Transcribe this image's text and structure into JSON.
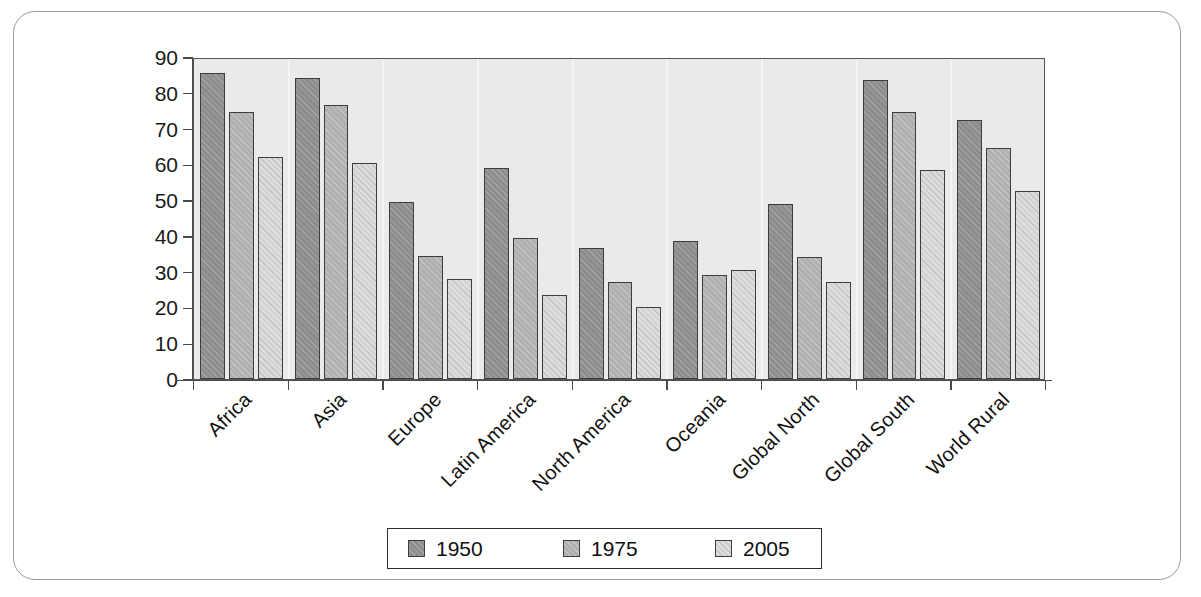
{
  "chart_data": {
    "type": "bar",
    "title": "",
    "subtitle": "",
    "xlabel": "",
    "ylabel": "",
    "ylim": [
      0,
      90
    ],
    "yticks": [
      0,
      10,
      20,
      30,
      40,
      50,
      60,
      70,
      80,
      90
    ],
    "grid": false,
    "legend_position": "bottom",
    "categories": [
      "Africa",
      "Asia",
      "Europe",
      "Latin America",
      "North America",
      "Oceania",
      "Global North",
      "Global South",
      "World Rural"
    ],
    "series": [
      {
        "name": "1950",
        "color": "#8d8d8d",
        "values": [
          85.5,
          84.0,
          49.5,
          59.0,
          36.5,
          38.5,
          49.0,
          83.5,
          72.5
        ]
      },
      {
        "name": "1975",
        "color": "#b0b0b0",
        "values": [
          74.5,
          76.5,
          34.5,
          39.5,
          27.0,
          29.0,
          34.0,
          74.5,
          64.5
        ]
      },
      {
        "name": "2005",
        "color": "#dcdcdc",
        "values": [
          62.0,
          60.5,
          28.0,
          23.5,
          20.0,
          30.5,
          27.0,
          58.5,
          52.5
        ]
      }
    ]
  },
  "legend": {
    "items": [
      {
        "label": "1950"
      },
      {
        "label": "1975"
      },
      {
        "label": "2005"
      }
    ]
  },
  "axis": {
    "y_tick_labels": [
      "90",
      "80",
      "70",
      "60",
      "50",
      "40",
      "30",
      "20",
      "10",
      "0"
    ]
  },
  "colors": {
    "plot_background": "#eaeaea",
    "frame_border": "#9a9a9a",
    "axis": "#4a4a4a",
    "bar_1950": "#8d8d8d",
    "bar_1975": "#b0b0b0",
    "bar_2005": "#dcdcdc"
  }
}
